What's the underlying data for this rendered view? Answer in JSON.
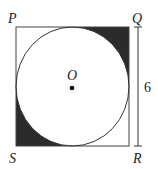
{
  "diagram": {
    "labels": {
      "P": "P",
      "Q": "Q",
      "R": "R",
      "S": "S",
      "O": "O"
    },
    "dimension": {
      "side_length": "6",
      "along": "QR"
    },
    "shaded_regions": [
      "corner near Q",
      "corner near S"
    ],
    "colors": {
      "shade": "#2b2b2b",
      "stroke": "#333333"
    }
  }
}
